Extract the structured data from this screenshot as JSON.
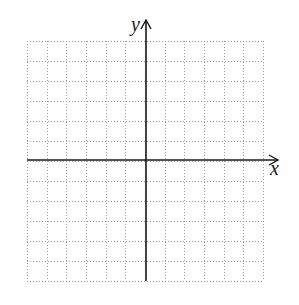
{
  "diagram": {
    "type": "coordinate-plane",
    "x_axis_label": "x",
    "y_axis_label": "y",
    "grid": {
      "columns": 12,
      "rows": 12,
      "left": 27,
      "top": 41,
      "right": 263,
      "bottom": 281,
      "line_style": "dotted",
      "line_color": "#9a9a9a"
    },
    "axes": {
      "origin_x": 146,
      "origin_y": 160,
      "x_arrow_tip": 278,
      "y_arrow_tip": 20,
      "color": "#1a1a1a"
    }
  }
}
